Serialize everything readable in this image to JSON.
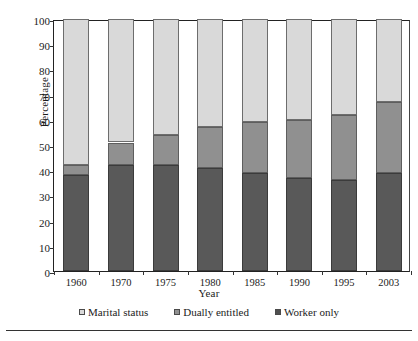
{
  "chart_data": {
    "type": "bar",
    "subtype": "stacked-column-100",
    "title": "",
    "xlabel": "Year",
    "ylabel": "Percentage",
    "ylim": [
      0,
      100
    ],
    "yticks": [
      0,
      10,
      20,
      30,
      40,
      50,
      60,
      70,
      80,
      90,
      100
    ],
    "grid": false,
    "legend_position": "bottom",
    "categories": [
      "1960",
      "1970",
      "1975",
      "1980",
      "1985",
      "1990",
      "1995",
      "2003"
    ],
    "series": [
      {
        "name": "Worker only",
        "color": "#595959",
        "values": [
          38,
          42,
          42,
          41,
          39,
          37,
          36,
          39
        ]
      },
      {
        "name": "Dually entitled",
        "color": "#909090",
        "values": [
          4,
          9,
          12,
          16,
          20,
          23,
          26,
          28
        ]
      },
      {
        "name": "Marital status",
        "color": "#d9d9d9",
        "values": [
          58,
          49,
          46,
          43,
          41,
          40,
          38,
          33
        ]
      }
    ],
    "cumulative_tops": {
      "worker_only": [
        38,
        42,
        42,
        41,
        39,
        37,
        36,
        39
      ],
      "plus_dually_entitled": [
        42,
        51,
        54,
        57,
        59,
        60,
        62,
        67
      ],
      "total": [
        100,
        100,
        100,
        100,
        100,
        100,
        100,
        100
      ]
    }
  },
  "axes": {
    "y_title": "Percentage",
    "x_title": "Year",
    "y_tick_labels": [
      "100",
      "90",
      "80",
      "70",
      "60",
      "50",
      "40",
      "30",
      "20",
      "10",
      "0"
    ],
    "x_tick_labels": [
      "1960",
      "1970",
      "1975",
      "1980",
      "1985",
      "1990",
      "1995",
      "2003"
    ]
  },
  "legend": {
    "items": [
      {
        "label": "Marital status",
        "swatch": "marital"
      },
      {
        "label": "Dually entitled",
        "swatch": "dually"
      },
      {
        "label": "Worker only",
        "swatch": "worker"
      }
    ]
  },
  "colors": {
    "marital_status": "#d9d9d9",
    "dually_entitled": "#909090",
    "worker_only": "#595959",
    "axis": "#222222",
    "background": "#ffffff"
  }
}
